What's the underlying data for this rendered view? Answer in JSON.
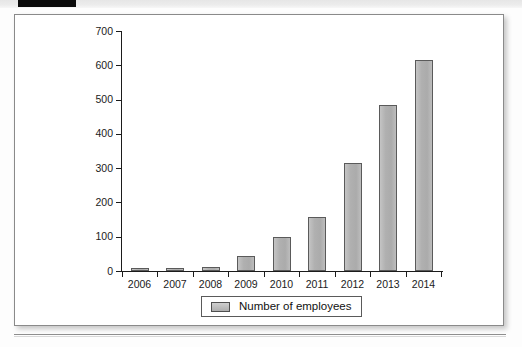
{
  "scan": {
    "marker_label": "",
    "band_label": ""
  },
  "chart_data": {
    "type": "bar",
    "title": "",
    "subtitle": "",
    "xlabel": "",
    "ylabel": "",
    "categories": [
      "2006",
      "2007",
      "2008",
      "2009",
      "2010",
      "2011",
      "2012",
      "2013",
      "2014"
    ],
    "values": [
      4,
      5,
      13,
      45,
      100,
      158,
      315,
      483,
      616
    ],
    "series": [
      {
        "name": "Number of employees",
        "values": [
          4,
          5,
          13,
          45,
          100,
          158,
          315,
          483,
          616
        ]
      }
    ],
    "ylim": [
      0,
      700
    ],
    "ytick_values": [
      0,
      100,
      200,
      300,
      400,
      500,
      600,
      700
    ],
    "ytick_labels": [
      "0",
      "100",
      "200",
      "300",
      "400",
      "500",
      "600",
      "700"
    ],
    "xtick_labels": [
      "2006",
      "2007",
      "2008",
      "2009",
      "2010",
      "2011",
      "2012",
      "2013",
      "2014"
    ],
    "grid": false,
    "legend": {
      "position": "bottom-center",
      "entries": [
        "Number of employees"
      ]
    },
    "annotations": [],
    "colors": {
      "bar_fill": "#b3b3b3",
      "bar_stroke": "#5a5a5a",
      "axis": "#1b1b1b",
      "frame": "#8a8a8a",
      "background": "#ffffff"
    }
  }
}
